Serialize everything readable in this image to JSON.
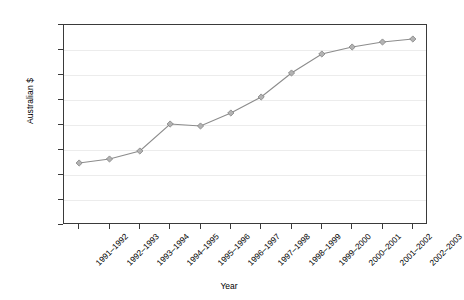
{
  "chart_data": {
    "type": "line",
    "title": "",
    "subtitle": "",
    "xlabel": "Year",
    "ylabel": "Australian $",
    "categories": [
      "1991–1992",
      "1992–1993",
      "1993–1994",
      "1994–1995",
      "1995–1996",
      "1996–1997",
      "1997–1998",
      "1998–1999",
      "1999–2000",
      "2000–2001",
      "2001–2002",
      "2002–2003"
    ],
    "values": [
      248,
      264,
      296,
      404,
      396,
      448,
      512,
      608,
      684,
      712,
      732,
      744
    ],
    "ylim": [
      0,
      800
    ],
    "yticks": [
      0,
      100,
      200,
      300,
      400,
      500,
      600,
      700,
      800
    ],
    "ytick_labels": [
      "0",
      "100",
      "200",
      "300",
      "400",
      "500",
      "600",
      "700",
      "800"
    ],
    "grid": true,
    "grid_axis": "y",
    "legend": false,
    "legend_position": "none",
    "marker": "diamond",
    "series": [
      {
        "name": "Australian $",
        "values": [
          248,
          264,
          296,
          404,
          396,
          448,
          512,
          608,
          684,
          712,
          732,
          744
        ]
      }
    ],
    "colors": {
      "line": "#8c8c8c",
      "marker_fill": "#b3b3b3",
      "marker_edge": "#808080",
      "grid": "#ececec",
      "axis": "#3a3a3a",
      "text": "#000000",
      "background": "#ffffff"
    }
  }
}
